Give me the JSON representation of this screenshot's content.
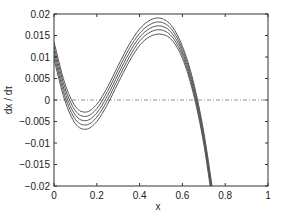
{
  "chart_data": {
    "type": "line",
    "title": "",
    "xlabel": "x",
    "ylabel": "dx / dτ",
    "xlim": [
      0,
      1
    ],
    "ylim": [
      -0.02,
      0.02
    ],
    "xticks": [
      0,
      0.2,
      0.4,
      0.6,
      0.8,
      1
    ],
    "xtick_labels": [
      "0",
      "0.2",
      "0.4",
      "0.6",
      "0.8",
      "1"
    ],
    "yticks": [
      0.02,
      0.015,
      0.01,
      0.005,
      0,
      -0.005,
      -0.01,
      -0.015,
      -0.02
    ],
    "ytick_labels": [
      "0.02",
      "0.015",
      "0.01",
      "0.005",
      "0",
      "−0.005",
      "−0.01",
      "−0.015",
      "−0.02"
    ],
    "grid": false,
    "legend": null,
    "reference_line": {
      "y": 0,
      "style": "dash-dot"
    },
    "x": [
      0,
      0.05,
      0.1,
      0.15,
      0.2,
      0.25,
      0.3,
      0.35,
      0.4,
      0.45,
      0.5,
      0.55,
      0.6,
      0.65,
      0.7,
      0.75
    ],
    "series": [
      {
        "name": "curve 1",
        "values": [
          0.0135,
          0.004,
          -0.0015,
          -0.0028,
          -0.001,
          0.003,
          0.008,
          0.0128,
          0.0165,
          0.0186,
          0.019,
          0.0172,
          0.0125,
          0.0045,
          -0.0075,
          -0.024
        ]
      },
      {
        "name": "curve 2",
        "values": [
          0.0125,
          0.003,
          -0.0025,
          -0.0038,
          -0.002,
          0.002,
          0.007,
          0.0118,
          0.0155,
          0.0176,
          0.0181,
          0.0164,
          0.0118,
          0.0038,
          -0.0082,
          -0.0248
        ]
      },
      {
        "name": "curve 3",
        "values": [
          0.0115,
          0.002,
          -0.0035,
          -0.0048,
          -0.003,
          0.001,
          0.006,
          0.0108,
          0.0146,
          0.0167,
          0.0172,
          0.0156,
          0.0111,
          0.0031,
          -0.0089,
          -0.0256
        ]
      },
      {
        "name": "curve 4",
        "values": [
          0.0105,
          0.001,
          -0.0045,
          -0.0058,
          -0.004,
          0.0,
          0.005,
          0.0098,
          0.0137,
          0.0158,
          0.0163,
          0.0148,
          0.0104,
          0.0024,
          -0.0096,
          -0.0264
        ]
      },
      {
        "name": "curve 5",
        "values": [
          0.0095,
          0.0,
          -0.0055,
          -0.0068,
          -0.005,
          -0.001,
          0.004,
          0.0088,
          0.0127,
          0.0148,
          0.0153,
          0.014,
          0.0097,
          0.0017,
          -0.0103,
          -0.0272
        ]
      }
    ],
    "colors": {
      "line": "#555555",
      "axis": "#333333",
      "zero_line": "#777777"
    }
  }
}
